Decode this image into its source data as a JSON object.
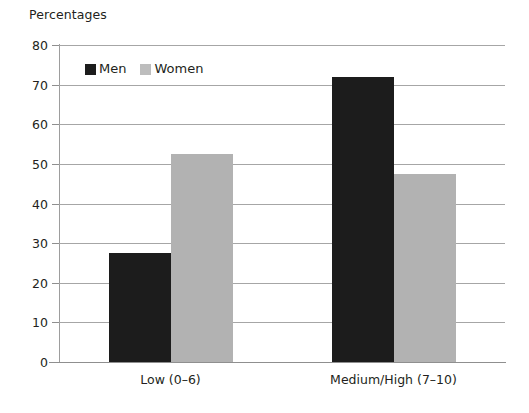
{
  "chart_data": {
    "type": "bar",
    "title": "Percentages",
    "xlabel": "",
    "ylabel": "",
    "ylim": [
      0,
      80
    ],
    "yticks": [
      0,
      10,
      20,
      30,
      40,
      50,
      60,
      70,
      80
    ],
    "ytick_labels": [
      "0",
      "10",
      "20",
      "30",
      "40",
      "50",
      "60",
      "70",
      "80"
    ],
    "grid": true,
    "legend_position": "upper-left-inside",
    "categories": [
      "Low (0–6)",
      "Medium/High (7–10)"
    ],
    "series": [
      {
        "name": "Men",
        "color": "#1c1c1c",
        "values": [
          27.5,
          72.0
        ]
      },
      {
        "name": "Women",
        "color": "#b2b2b2",
        "values": [
          52.5,
          47.5
        ]
      }
    ]
  },
  "legend": {
    "items": [
      {
        "label": "Men",
        "swatch": "men"
      },
      {
        "label": "Women",
        "swatch": "women"
      }
    ]
  }
}
